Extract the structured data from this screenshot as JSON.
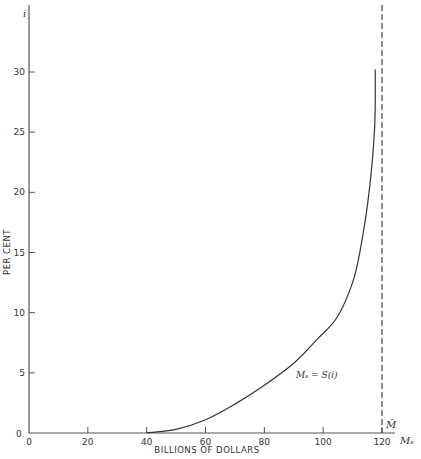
{
  "chart_data": {
    "type": "line",
    "title": "",
    "xlabel": "BILLIONS OF DOLLARS",
    "ylabel": "PER CENT",
    "x_axis_symbol": "M_s",
    "y_axis_symbol": "i",
    "xlim": [
      0,
      125
    ],
    "ylim": [
      0,
      33
    ],
    "x_ticks": [
      0,
      20,
      40,
      60,
      80,
      100,
      120
    ],
    "y_ticks": [
      0,
      5,
      10,
      15,
      20,
      25,
      30
    ],
    "grid": false,
    "series": [
      {
        "name": "M_s = S(i)",
        "label": "Mₛ = S(i)",
        "style": "solid",
        "points": [
          {
            "x": 40,
            "y": 0
          },
          {
            "x": 50,
            "y": 0.3
          },
          {
            "x": 60,
            "y": 1.1
          },
          {
            "x": 70,
            "y": 2.4
          },
          {
            "x": 79,
            "y": 3.8
          },
          {
            "x": 90,
            "y": 5.8
          },
          {
            "x": 98,
            "y": 7.8
          },
          {
            "x": 104.7,
            "y": 9.6
          },
          {
            "x": 110,
            "y": 12.5
          },
          {
            "x": 112.6,
            "y": 15.2
          },
          {
            "x": 115.6,
            "y": 20
          },
          {
            "x": 117.5,
            "y": 25.4
          },
          {
            "x": 117.7,
            "y": 30.2
          }
        ]
      }
    ],
    "reference_lines": [
      {
        "orientation": "vertical",
        "x": 120,
        "style": "dashed",
        "label": "M̄"
      }
    ],
    "annotations": [
      {
        "text": "Mₛ = S(i)",
        "x": 92,
        "y": 2.5
      }
    ]
  },
  "labels": {
    "y_symbol": "i",
    "x_symbol": "Mₛ",
    "y_title": "PER CENT",
    "x_title": "BILLIONS OF DOLLARS",
    "curve_label": "Mₛ = S(i)",
    "mbar_label": "M̄",
    "y_zero": "0",
    "x_tick_labels": [
      "0",
      "20",
      "40",
      "60",
      "80",
      "100",
      "120"
    ],
    "y_tick_labels": [
      "0",
      "5",
      "10",
      "15",
      "20",
      "25",
      "30"
    ]
  },
  "colors": {
    "axis": "#555555",
    "curve": "#333333",
    "text": "#333333"
  }
}
